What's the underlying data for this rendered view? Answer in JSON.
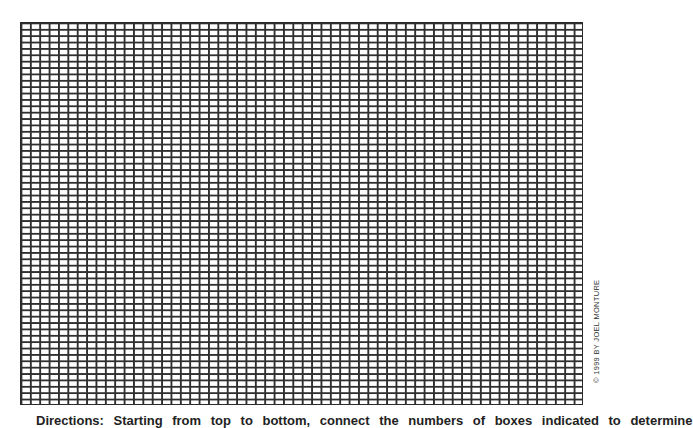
{
  "worksheet": {
    "grid": {
      "columns": 60,
      "rows": 60,
      "line_color": "#2f2f2f",
      "background": "#ffffff"
    },
    "copyright": "© 1999 BY JOEL MONTURE",
    "directions": "Directions: Starting from top to bottom, connect the numbers of boxes indicated to determine"
  }
}
